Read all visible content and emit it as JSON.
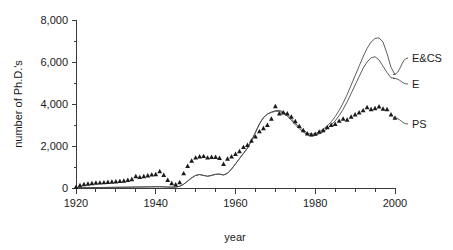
{
  "chart_data": {
    "type": "line",
    "title": "",
    "xlabel": "year",
    "ylabel": "number of Ph.D.'s",
    "xlim": [
      1920,
      2000
    ],
    "ylim": [
      0,
      8000
    ],
    "xticks": [
      1920,
      1940,
      1960,
      1980,
      2000
    ],
    "xtick_labels": [
      "1920",
      "1940",
      "1960",
      "1980",
      "2000"
    ],
    "xminor_step": 5,
    "yticks": [
      0,
      2000,
      4000,
      6000,
      8000
    ],
    "ytick_labels": [
      "0",
      "2,000",
      "4,000",
      "6,000",
      "8,000"
    ],
    "grid": false,
    "legend_position": "right-inline",
    "series": [
      {
        "name": "E&CS",
        "label": "E&CS",
        "style": "line",
        "color": "#4a4a4a",
        "x": [
          1920,
          1921,
          1922,
          1923,
          1924,
          1925,
          1926,
          1927,
          1928,
          1929,
          1930,
          1931,
          1932,
          1933,
          1934,
          1935,
          1936,
          1937,
          1938,
          1939,
          1940,
          1941,
          1942,
          1943,
          1944,
          1945,
          1946,
          1947,
          1948,
          1949,
          1950,
          1951,
          1952,
          1953,
          1954,
          1955,
          1956,
          1957,
          1958,
          1959,
          1960,
          1961,
          1962,
          1963,
          1964,
          1965,
          1966,
          1967,
          1968,
          1969,
          1970,
          1971,
          1972,
          1973,
          1974,
          1975,
          1976,
          1977,
          1978,
          1979,
          1980,
          1981,
          1982,
          1983,
          1984,
          1985,
          1986,
          1987,
          1988,
          1989,
          1990,
          1991,
          1992,
          1993,
          1994,
          1995,
          1996,
          1997,
          1998,
          1999,
          2000
        ],
        "y": [
          10,
          12,
          14,
          16,
          18,
          20,
          22,
          25,
          28,
          30,
          33,
          35,
          38,
          40,
          43,
          45,
          48,
          50,
          53,
          55,
          58,
          60,
          55,
          45,
          40,
          45,
          80,
          180,
          330,
          480,
          600,
          640,
          600,
          560,
          600,
          650,
          660,
          620,
          700,
          900,
          1150,
          1400,
          1650,
          1900,
          2250,
          2650,
          3050,
          3350,
          3520,
          3620,
          3680,
          3700,
          3620,
          3480,
          3300,
          3080,
          2900,
          2750,
          2620,
          2560,
          2580,
          2680,
          2800,
          2950,
          3150,
          3400,
          3700,
          4050,
          4450,
          4900,
          5350,
          5800,
          6250,
          6650,
          6950,
          7120,
          7150,
          6950,
          6400,
          5750,
          5400
        ]
      },
      {
        "name": "E",
        "label": "E",
        "style": "line",
        "color": "#4a4a4a",
        "x": [
          1920,
          1921,
          1922,
          1923,
          1924,
          1925,
          1926,
          1927,
          1928,
          1929,
          1930,
          1931,
          1932,
          1933,
          1934,
          1935,
          1936,
          1937,
          1938,
          1939,
          1940,
          1941,
          1942,
          1943,
          1944,
          1945,
          1946,
          1947,
          1948,
          1949,
          1950,
          1951,
          1952,
          1953,
          1954,
          1955,
          1956,
          1957,
          1958,
          1959,
          1960,
          1961,
          1962,
          1963,
          1964,
          1965,
          1966,
          1967,
          1968,
          1969,
          1970,
          1971,
          1972,
          1973,
          1974,
          1975,
          1976,
          1977,
          1978,
          1979,
          1980,
          1981,
          1982,
          1983,
          1984,
          1985,
          1986,
          1987,
          1988,
          1989,
          1990,
          1991,
          1992,
          1993,
          1994,
          1995,
          1996,
          1997,
          1998,
          1999,
          2000
        ],
        "y": [
          10,
          12,
          14,
          16,
          18,
          20,
          22,
          25,
          28,
          30,
          33,
          35,
          38,
          40,
          43,
          45,
          48,
          50,
          53,
          55,
          58,
          60,
          55,
          45,
          40,
          45,
          80,
          180,
          330,
          480,
          600,
          640,
          600,
          560,
          600,
          650,
          660,
          620,
          700,
          900,
          1150,
          1400,
          1650,
          1900,
          2250,
          2650,
          3050,
          3350,
          3520,
          3600,
          3650,
          3650,
          3560,
          3420,
          3230,
          3000,
          2820,
          2670,
          2540,
          2480,
          2500,
          2580,
          2680,
          2820,
          3000,
          3200,
          3450,
          3750,
          4100,
          4500,
          4900,
          5300,
          5700,
          6000,
          6200,
          6250,
          6100,
          5800,
          5500,
          5250,
          5220
        ]
      },
      {
        "name": "PS",
        "label": "PS",
        "style": "markers",
        "marker": "triangle",
        "color": "#1a1a1a",
        "x": [
          1920,
          1921,
          1922,
          1923,
          1924,
          1925,
          1926,
          1927,
          1928,
          1929,
          1930,
          1931,
          1932,
          1933,
          1934,
          1935,
          1936,
          1937,
          1938,
          1939,
          1940,
          1941,
          1942,
          1943,
          1944,
          1945,
          1946,
          1947,
          1948,
          1949,
          1950,
          1951,
          1952,
          1953,
          1954,
          1955,
          1956,
          1957,
          1958,
          1959,
          1960,
          1961,
          1962,
          1963,
          1964,
          1965,
          1966,
          1967,
          1968,
          1969,
          1970,
          1971,
          1972,
          1973,
          1974,
          1975,
          1976,
          1977,
          1978,
          1979,
          1980,
          1981,
          1982,
          1983,
          1984,
          1985,
          1986,
          1987,
          1988,
          1989,
          1990,
          1991,
          1992,
          1993,
          1994,
          1995,
          1996,
          1997,
          1998,
          1999,
          2000
        ],
        "y": [
          50,
          130,
          180,
          210,
          230,
          250,
          260,
          270,
          290,
          300,
          310,
          330,
          350,
          380,
          420,
          560,
          520,
          560,
          600,
          640,
          660,
          800,
          620,
          380,
          230,
          170,
          280,
          700,
          1050,
          1300,
          1450,
          1500,
          1520,
          1450,
          1480,
          1480,
          1430,
          1150,
          1400,
          1500,
          1620,
          1750,
          1950,
          2050,
          2250,
          2450,
          2700,
          2850,
          3000,
          3300,
          3900,
          3550,
          3600,
          3550,
          3400,
          3180,
          2950,
          2750,
          2600,
          2550,
          2580,
          2680,
          2750,
          2900,
          3000,
          3050,
          3200,
          3300,
          3250,
          3400,
          3500,
          3600,
          3700,
          3850,
          3750,
          3800,
          3880,
          3780,
          3750,
          3500,
          3350
        ]
      }
    ],
    "annotations": []
  }
}
